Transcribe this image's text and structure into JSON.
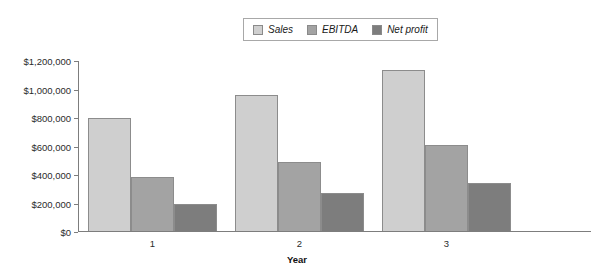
{
  "chart_data": {
    "type": "bar",
    "title": "",
    "xlabel": "Year",
    "ylabel": "",
    "categories": [
      "1",
      "2",
      "3"
    ],
    "series": [
      {
        "name": "Sales",
        "color": "#cfcfcf",
        "values": [
          800000,
          960000,
          1140000
        ]
      },
      {
        "name": "EBITDA",
        "color": "#a3a3a3",
        "values": [
          385000,
          490000,
          610000
        ]
      },
      {
        "name": "Net profit",
        "color": "#7d7d7d",
        "values": [
          200000,
          275000,
          345000
        ]
      }
    ],
    "ylim": [
      0,
      1200000
    ],
    "yticks": [
      0,
      200000,
      400000,
      600000,
      800000,
      1000000,
      1200000
    ],
    "ytick_labels": [
      "$0",
      "$200,000",
      "$400,000",
      "$600,000",
      "$800,000",
      "$1,000,000",
      "$1,200,000"
    ],
    "grid": false,
    "legend_position": "top-center"
  },
  "legend": {
    "entries": [
      {
        "label": "Sales"
      },
      {
        "label": "EBITDA"
      },
      {
        "label": "Net profit"
      }
    ]
  },
  "axes": {
    "x": {
      "label": "Year",
      "tick_labels": [
        "1",
        "2",
        "3"
      ]
    },
    "y": {
      "tick_labels": [
        "$1,200,000",
        "$1,000,000",
        "$800,000",
        "$600,000",
        "$400,000",
        "$200,000",
        "$0"
      ]
    }
  }
}
